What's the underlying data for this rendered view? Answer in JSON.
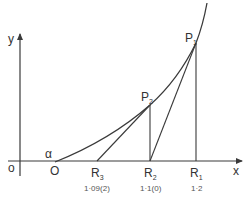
{
  "diagram": {
    "type": "geometry-construction",
    "colors": {
      "line": "#3a3a3a",
      "text": "#333333",
      "background": "#ffffff"
    },
    "axes": {
      "x_label": "x",
      "y_label": "y",
      "origin_label": "o"
    },
    "curve": {
      "start_label": "O",
      "angle_label": "α"
    },
    "points": {
      "P1": {
        "letter": "P",
        "sub": "1"
      },
      "P2": {
        "letter": "P",
        "sub": "2"
      },
      "R1": {
        "letter": "R",
        "sub": "1",
        "value": "1·2"
      },
      "R2": {
        "letter": "R",
        "sub": "2",
        "value": "1·1(0)"
      },
      "R3": {
        "letter": "R",
        "sub": "3",
        "value": "1·09(2)"
      }
    },
    "segments": [
      {
        "from": "R3",
        "to": "P2",
        "kind": "tangent"
      },
      {
        "from": "R2",
        "to": "P1",
        "kind": "tangent"
      },
      {
        "from": "R2",
        "to": "P2",
        "kind": "ordinate"
      },
      {
        "from": "R1",
        "to": "P1",
        "kind": "ordinate"
      }
    ]
  }
}
